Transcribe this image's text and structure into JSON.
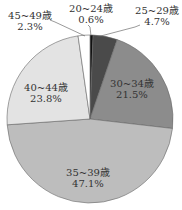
{
  "chart_data": {
    "type": "pie",
    "title": "",
    "categories": [
      "20~24歳",
      "25~29歳",
      "30~34歳",
      "35~39歳",
      "40~44歳",
      "45~49歳"
    ],
    "values": [
      0.6,
      4.7,
      21.5,
      47.1,
      23.8,
      2.3
    ],
    "value_labels": [
      "0.6%",
      "4.7%",
      "21.5%",
      "47.1%",
      "23.8%",
      "2.3%"
    ],
    "colors": [
      "#111111",
      "#4a4a4a",
      "#8c8c8c",
      "#bdbdbd",
      "#e3e3e3",
      "#ffffff"
    ],
    "start_angle": "12 o'clock",
    "direction": "clockwise",
    "legend": "none (labels on/around slices)"
  },
  "labels": [
    {
      "name": "20~24歳",
      "pct": "0.6%"
    },
    {
      "name": "25~29歳",
      "pct": "4.7%"
    },
    {
      "name": "30~34歳",
      "pct": "21.5%"
    },
    {
      "name": "35~39歳",
      "pct": "47.1%"
    },
    {
      "name": "40~44歳",
      "pct": "23.8%"
    },
    {
      "name": "45~49歳",
      "pct": "2.3%"
    }
  ]
}
